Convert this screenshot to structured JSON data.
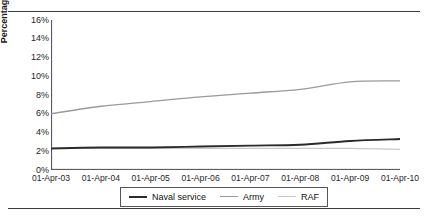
{
  "figure": {
    "clipped_header_text": "",
    "y_axis_title": "Percentage"
  },
  "legend": {
    "items": [
      {
        "label": "Naval service",
        "color": "#2b2b2b"
      },
      {
        "label": "Army",
        "color": "#9a9a9a"
      },
      {
        "label": "RAF",
        "color": "#c8c8c8"
      }
    ]
  },
  "chart_data": {
    "type": "line",
    "title": "",
    "xlabel": "",
    "ylabel": "Percentage",
    "x": [
      "01-Apr-03",
      "01-Apr-04",
      "01-Apr-05",
      "01-Apr-06",
      "01-Apr-07",
      "01-Apr-08",
      "01-Apr-09",
      "01-Apr-10"
    ],
    "categories": [
      "01-Apr-03",
      "01-Apr-04",
      "01-Apr-05",
      "01-Apr-06",
      "01-Apr-07",
      "01-Apr-08",
      "01-Apr-09",
      "01-Apr-10"
    ],
    "ytick_labels": [
      "16%",
      "14%",
      "12%",
      "10%",
      "8%",
      "6%",
      "4%",
      "2%",
      "0%"
    ],
    "ytick_values": [
      16,
      14,
      12,
      10,
      8,
      6,
      4,
      2,
      0
    ],
    "ylim": [
      0,
      16
    ],
    "grid": false,
    "legend_position": "bottom",
    "series": [
      {
        "name": "Naval service",
        "color": "#2b2b2b",
        "values": [
          2.3,
          2.4,
          2.4,
          2.5,
          2.6,
          2.7,
          3.1,
          3.3
        ]
      },
      {
        "name": "Army",
        "color": "#9a9a9a",
        "values": [
          6.0,
          6.8,
          7.3,
          7.8,
          8.2,
          8.6,
          9.4,
          9.5
        ]
      },
      {
        "name": "RAF",
        "color": "#c8c8c8",
        "values": [
          2.3,
          2.3,
          2.3,
          2.3,
          2.3,
          2.3,
          2.3,
          2.2
        ]
      }
    ]
  }
}
